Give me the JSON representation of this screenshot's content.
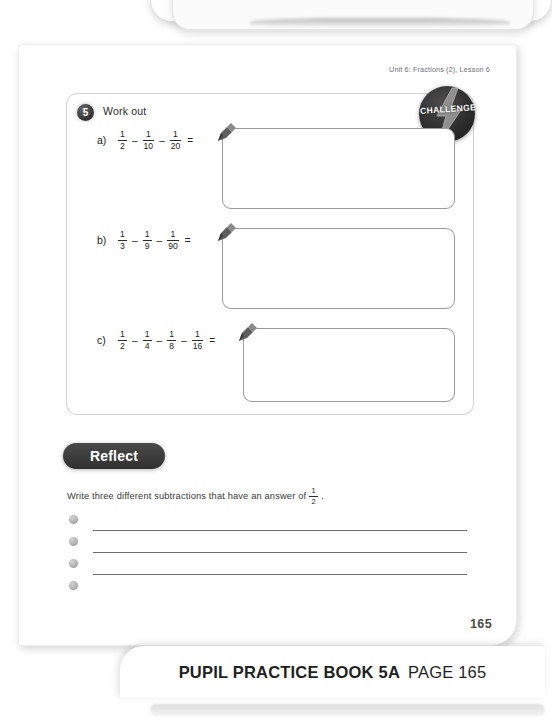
{
  "header": {
    "unit_label": "Unit 6: Fractions (2), Lesson 6"
  },
  "question": {
    "number": "5",
    "title": "Work out",
    "badge": {
      "label": "CHALLENGE",
      "icon": "lightning-bolt-icon",
      "color": "#262626"
    },
    "parts": [
      {
        "label": "a)",
        "terms": [
          {
            "num": "1",
            "den": "2"
          },
          {
            "num": "1",
            "den": "10"
          },
          {
            "num": "1",
            "den": "20"
          }
        ],
        "operator": "–",
        "equals": "=",
        "answer": ""
      },
      {
        "label": "b)",
        "terms": [
          {
            "num": "1",
            "den": "3"
          },
          {
            "num": "1",
            "den": "9"
          },
          {
            "num": "1",
            "den": "90"
          }
        ],
        "operator": "–",
        "equals": "=",
        "answer": ""
      },
      {
        "label": "c)",
        "terms": [
          {
            "num": "1",
            "den": "2"
          },
          {
            "num": "1",
            "den": "4"
          },
          {
            "num": "1",
            "den": "8"
          },
          {
            "num": "1",
            "den": "16"
          }
        ],
        "operator": "–",
        "equals": "=",
        "answer": ""
      }
    ]
  },
  "reflect": {
    "heading": "Reflect",
    "prompt_before": "Write three different subtractions that have an answer of",
    "prompt_fraction": {
      "num": "1",
      "den": "2"
    },
    "prompt_after": ".",
    "lines": [
      "",
      "",
      ""
    ]
  },
  "page_number": "165",
  "footer": {
    "title": "PUPIL PRACTICE BOOK 5A",
    "page": "PAGE 165"
  }
}
